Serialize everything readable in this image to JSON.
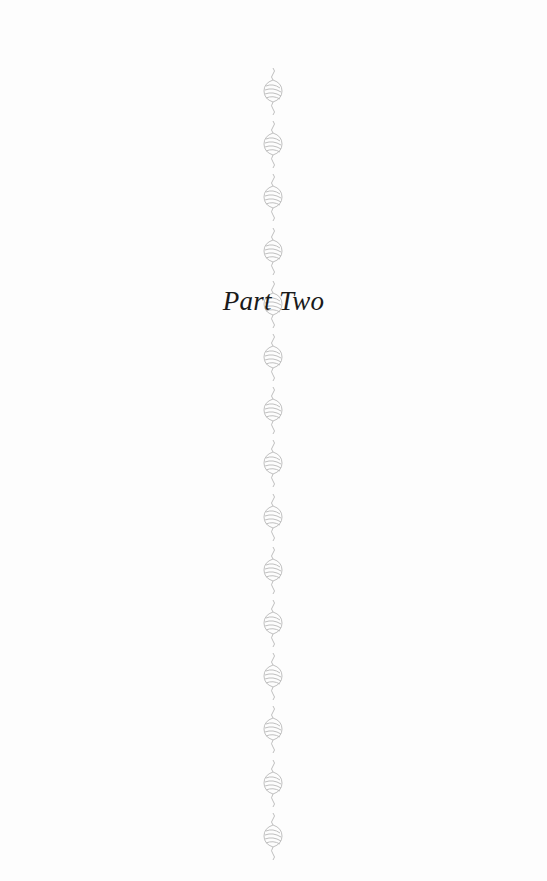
{
  "page": {
    "title": "Part Two",
    "ornament_icon": "flourish-ornament-icon",
    "ornament_color": "#b8b8b8",
    "ornament_count": 15
  }
}
